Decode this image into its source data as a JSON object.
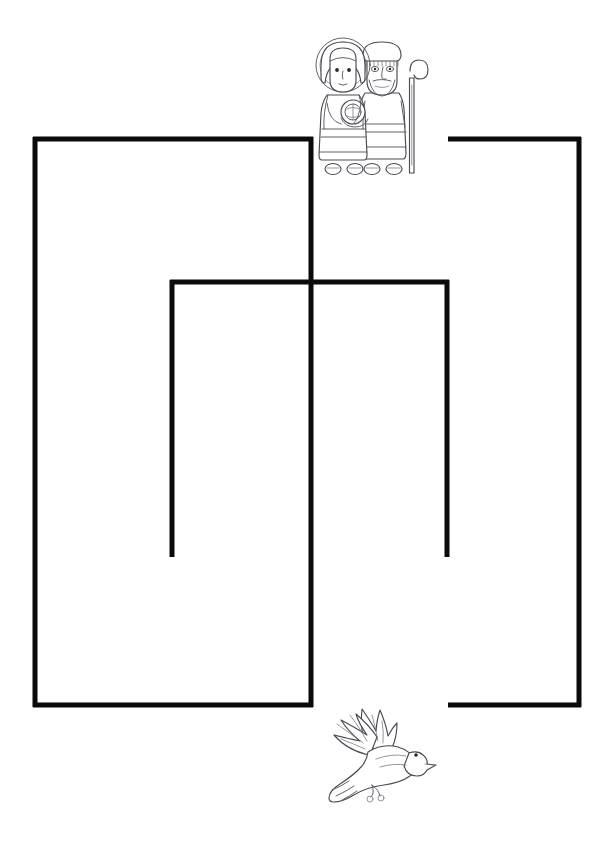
{
  "page": {
    "width": 614,
    "height": 845,
    "background_color": "#ffffff",
    "header_text": ""
  },
  "maze": {
    "name": "nativity-maze",
    "wall_color": "#0b0b0b",
    "wall_thickness_px": 5,
    "start_label": "",
    "end_label": "",
    "entrance_gap": {
      "top_x_from": 311,
      "top_x_to": 448
    },
    "exit_gap": {
      "bottom_x_from": 311,
      "bottom_x_to": 448
    },
    "walls": [
      {
        "name": "left-block-left-wall",
        "type": "vline",
        "x": 35,
        "y1": 137,
        "y2": 707
      },
      {
        "name": "left-block-top-wall",
        "type": "hline",
        "y": 139,
        "x1": 33,
        "x2": 313
      },
      {
        "name": "left-block-right-wall",
        "type": "vline",
        "x": 311,
        "y1": 137,
        "y2": 420
      },
      {
        "name": "left-block-bottom-wall",
        "type": "hline",
        "y": 705,
        "x1": 33,
        "x2": 313
      },
      {
        "name": "center-divider-wall",
        "type": "vline",
        "x": 311,
        "y1": 420,
        "y2": 707
      },
      {
        "name": "inner-block-top-wall",
        "type": "hline",
        "y": 282,
        "x1": 170,
        "x2": 449
      },
      {
        "name": "inner-block-left-wall",
        "type": "vline",
        "x": 172,
        "y1": 280,
        "y2": 557
      },
      {
        "name": "inner-block-right-wall",
        "type": "vline",
        "x": 447,
        "y1": 280,
        "y2": 557
      },
      {
        "name": "right-block-top-wall",
        "type": "hline",
        "y": 139,
        "x1": 448,
        "x2": 581
      },
      {
        "name": "right-block-right-wall",
        "type": "vline",
        "x": 579,
        "y1": 137,
        "y2": 707
      },
      {
        "name": "right-block-bottom-wall",
        "type": "hline",
        "y": 705,
        "x1": 448,
        "x2": 581
      }
    ]
  },
  "illustrations": [
    {
      "name": "holy-family-illustration",
      "subject": "Mary holding baby Jesus beside Joseph with a shepherd's staff",
      "position": "top-center",
      "style": "black-and-white line art",
      "x": 305,
      "y": 33,
      "width": 135,
      "height": 145
    },
    {
      "name": "dove-illustration",
      "subject": "Dove in flight with outstretched wings",
      "position": "bottom-center",
      "style": "black-and-white line art",
      "x": 310,
      "y": 697,
      "width": 130,
      "height": 115
    }
  ]
}
